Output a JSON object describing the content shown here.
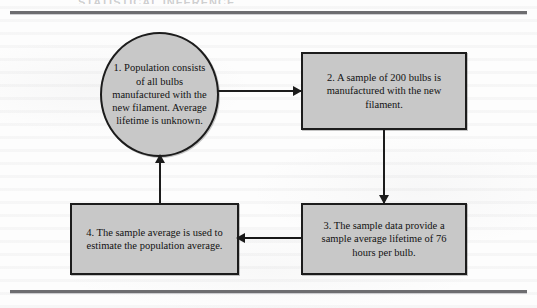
{
  "page": {
    "cut_heading_text": "STATISTICAL INFERENCE",
    "background_color": "#fdfdfd",
    "rule_color": "#6d6d70"
  },
  "diagram": {
    "type": "cycle-flowchart",
    "shape_fill_color": "#c8c8c8",
    "shape_border_color": "#1c1c1c",
    "connector_color": "#1c1c1c",
    "nodes": [
      {
        "id": "step1",
        "shape": "circle",
        "number": "1.",
        "text": "1.  Population consists of all bulbs manufactured with the new filament. Average lifetime is unknown.",
        "lines": [
          "1.  Population",
          "consists of all bulbs",
          "manufactured with",
          "the new filament.",
          "Average lifetime",
          "is unknown."
        ]
      },
      {
        "id": "step2",
        "shape": "rectangle",
        "number": "2.",
        "text": "2.  A sample of 200 bulbs is manufactured with the new filament.",
        "lines": [
          "2.  A sample of",
          "200 bulbs is",
          "manufactured with",
          "the new filament."
        ]
      },
      {
        "id": "step3",
        "shape": "rectangle",
        "number": "3.",
        "text": "3.  The sample data provide a sample average lifetime of 76 hours per bulb.",
        "lines": [
          "3.  The sample data provide",
          "a sample average lifetime",
          "of 76 hours per bulb."
        ]
      },
      {
        "id": "step4",
        "shape": "rectangle",
        "number": "4.",
        "text": "4.  The sample average is used to estimate the population average.",
        "lines": [
          "4.  The sample average",
          "is used to estimate the",
          "population average."
        ]
      }
    ],
    "connectors": [
      {
        "id": "c1",
        "from": "step1",
        "to": "step2",
        "direction": "right"
      },
      {
        "id": "c2",
        "from": "step2",
        "to": "step3",
        "direction": "down"
      },
      {
        "id": "c3",
        "from": "step3",
        "to": "step4",
        "direction": "left"
      },
      {
        "id": "c4",
        "from": "step4",
        "to": "step1",
        "direction": "up"
      }
    ]
  }
}
